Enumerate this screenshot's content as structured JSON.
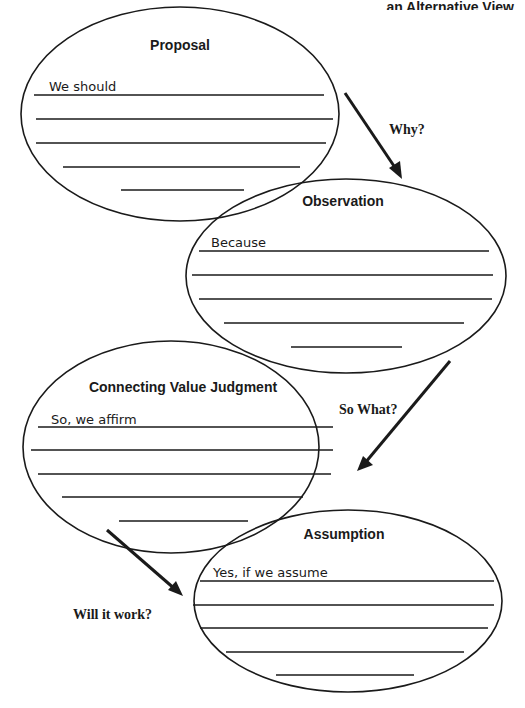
{
  "header": {
    "text": "an Alternative View"
  },
  "nodes": {
    "proposal": {
      "title": "Proposal",
      "prompt": "We should"
    },
    "observation": {
      "title": "Observation",
      "prompt": "Because"
    },
    "value": {
      "title": "Connecting Value Judgment",
      "prompt": "So, we affirm"
    },
    "assumption": {
      "title": "Assumption",
      "prompt": "Yes, if we assume"
    }
  },
  "edges": {
    "why": {
      "label": "Why?"
    },
    "so_what": {
      "label": "So What?"
    },
    "will_it_work": {
      "label": "Will it work?"
    }
  }
}
